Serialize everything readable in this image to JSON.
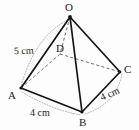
{
  "figure": {
    "kind": "geometry-diagram",
    "shape_name": "square-based pyramid",
    "stroke_color": "#1a1a1a",
    "hidden_edge_color": "#4d4d4d",
    "measure_arc_color": "#8a8a8a",
    "background": "#fdfdfd"
  },
  "vertices": [
    {
      "id": "O",
      "label": "O",
      "x": 70,
      "y": 17,
      "label_x": 65,
      "label_y": 2,
      "role": "apex",
      "visible_point": true
    },
    {
      "id": "A",
      "label": "A",
      "x": 21,
      "y": 88,
      "label_x": 8,
      "label_y": 90,
      "role": "base",
      "visible_point": true
    },
    {
      "id": "B",
      "label": "B",
      "x": 82,
      "y": 112,
      "label_x": 79,
      "label_y": 117,
      "role": "base",
      "visible_point": true
    },
    {
      "id": "C",
      "label": "C",
      "x": 120,
      "y": 72,
      "label_x": 124,
      "label_y": 64,
      "role": "base",
      "visible_point": true
    },
    {
      "id": "D",
      "label": "D",
      "x": 60,
      "y": 54,
      "label_x": 56,
      "label_y": 43,
      "role": "base-hidden",
      "visible_point": false
    }
  ],
  "edges": [
    {
      "id": "OA",
      "from": "O",
      "to": "A",
      "style": "solid",
      "hidden": false
    },
    {
      "id": "OB",
      "from": "O",
      "to": "B",
      "style": "solid",
      "hidden": false
    },
    {
      "id": "OC",
      "from": "O",
      "to": "C",
      "style": "solid",
      "hidden": false
    },
    {
      "id": "OD",
      "from": "O",
      "to": "D",
      "style": "dashed",
      "hidden": true
    },
    {
      "id": "AB",
      "from": "A",
      "to": "B",
      "style": "solid",
      "hidden": false
    },
    {
      "id": "BC",
      "from": "B",
      "to": "C",
      "style": "solid",
      "hidden": false
    },
    {
      "id": "AD",
      "from": "A",
      "to": "D",
      "style": "dashed",
      "hidden": true
    },
    {
      "id": "DC",
      "from": "D",
      "to": "C",
      "style": "dashed",
      "hidden": true
    }
  ],
  "measurements": [
    {
      "id": "OA-measure",
      "edge": "OA",
      "text": "5 cm",
      "label_x": 14,
      "label_y": 46
    },
    {
      "id": "AB-measure",
      "edge": "AB",
      "text": "4 cm",
      "label_x": 30,
      "label_y": 108
    },
    {
      "id": "BC-measure",
      "edge": "BC",
      "text": "4 cm",
      "label_x": 100,
      "label_y": 89
    }
  ]
}
